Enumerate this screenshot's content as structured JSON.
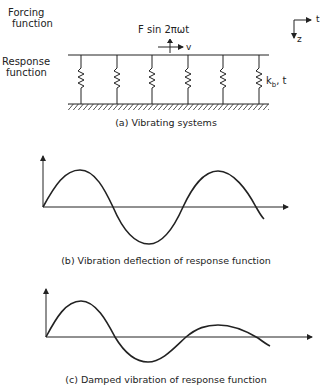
{
  "panel_a": {
    "forcing_label_1": "Forcing",
    "forcing_label_2": "function",
    "response_label_1": "Response",
    "response_label_2": "function",
    "force_expression": "F sin 2πωt",
    "velocity_label": "v",
    "spring_label": "kₕ, t",
    "spring_label_main": "k",
    "spring_label_sub": "b",
    "spring_label_tail": ", t",
    "axis_t": "t",
    "axis_z": "z",
    "spring_count": 6,
    "caption": "(a) Vibrating systems"
  },
  "panel_b": {
    "caption": "(b) Vibration deflection of response function"
  },
  "panel_c": {
    "caption": "(c) Damped vibration of response function"
  }
}
